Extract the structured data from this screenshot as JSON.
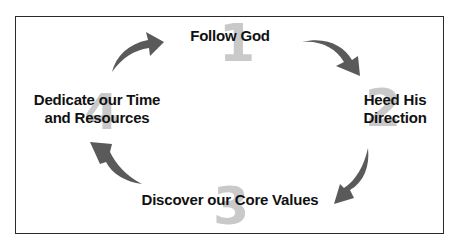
{
  "diagram": {
    "type": "cycle",
    "arrow_color": "#5a5a5a",
    "number_color": "#c9c9c9",
    "steps": [
      {
        "number": "1",
        "label": "Follow God"
      },
      {
        "number": "2",
        "label_line1": "Heed His",
        "label_line2": "Direction"
      },
      {
        "number": "3",
        "label": "Discover our Core Values"
      },
      {
        "number": "4",
        "label_line1": "Dedicate our Time",
        "label_line2": "and Resources"
      }
    ],
    "arrows": [
      {
        "from": "4",
        "to": "1",
        "icon": "curved-arrow-up-right-icon"
      },
      {
        "from": "1",
        "to": "2",
        "icon": "curved-arrow-down-right-icon"
      },
      {
        "from": "2",
        "to": "3",
        "icon": "curved-arrow-down-left-icon"
      },
      {
        "from": "3",
        "to": "4",
        "icon": "curved-arrow-up-left-icon"
      }
    ]
  }
}
